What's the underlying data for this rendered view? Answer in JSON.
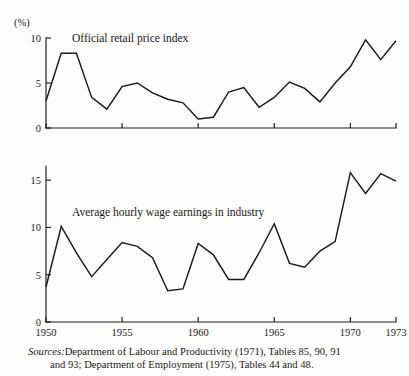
{
  "figure": {
    "unit_label": "(%)",
    "sources_label": "Sources:",
    "sources_text_line1": "Department of Labour and Productivity (1971), Tables 85, 90, 91",
    "sources_text_line2": "and 93; Department of Employment (1975), Tables 44 and 48."
  },
  "chart_data": [
    {
      "type": "line",
      "title": "Official retail price index",
      "xlabel": "",
      "ylabel": "(%)",
      "xlim": [
        1950,
        1973
      ],
      "ylim": [
        0,
        10
      ],
      "yticks": [
        0,
        5,
        10
      ],
      "ytick_labels": [
        "0",
        "5",
        "10"
      ],
      "xticks": [
        1950,
        1955,
        1960,
        1965,
        1970,
        1973
      ],
      "xtick_labels": [
        "1950",
        "1955",
        "1960",
        "1965",
        "1970",
        "1973"
      ],
      "grid": false,
      "legend": "none",
      "x": [
        1950,
        1951,
        1952,
        1953,
        1954,
        1955,
        1956,
        1957,
        1958,
        1959,
        1960,
        1961,
        1962,
        1963,
        1964,
        1965,
        1966,
        1967,
        1968,
        1969,
        1970,
        1971,
        1972,
        1973
      ],
      "values": [
        3.0,
        8.3,
        8.3,
        3.4,
        2.1,
        4.6,
        5.0,
        3.9,
        3.2,
        2.8,
        1.0,
        1.2,
        4.0,
        4.5,
        2.3,
        3.4,
        5.1,
        4.4,
        2.9,
        5.0,
        6.8,
        9.8,
        7.6,
        9.7
      ]
    },
    {
      "type": "line",
      "title": "Average hourly wage earnings in industry",
      "xlabel": "",
      "ylabel": "",
      "xlim": [
        1950,
        1973
      ],
      "ylim": [
        0,
        16.5
      ],
      "yticks": [
        0,
        5,
        10,
        15
      ],
      "ytick_labels": [
        "0",
        "5",
        "10",
        "15"
      ],
      "xticks": [
        1950,
        1955,
        1960,
        1965,
        1970,
        1973
      ],
      "xtick_labels": [
        "1950",
        "1955",
        "1960",
        "1965",
        "1970",
        "1973"
      ],
      "grid": false,
      "legend": "none",
      "x": [
        1950,
        1951,
        1952,
        1953,
        1954,
        1955,
        1956,
        1957,
        1958,
        1959,
        1960,
        1961,
        1962,
        1963,
        1964,
        1965,
        1966,
        1967,
        1968,
        1969,
        1970,
        1971,
        1972,
        1973
      ],
      "values": [
        3.7,
        10.1,
        7.3,
        4.8,
        6.6,
        8.4,
        8.0,
        6.8,
        3.3,
        3.5,
        8.3,
        7.1,
        4.5,
        4.5,
        7.3,
        10.4,
        6.2,
        5.8,
        7.5,
        8.5,
        15.8,
        13.6,
        15.7,
        14.9
      ]
    }
  ]
}
